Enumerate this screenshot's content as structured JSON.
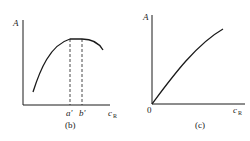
{
  "panels": [
    {
      "id": "b",
      "caption": "(b)",
      "y_label": "A",
      "x_label": "c",
      "x_label_sub": "R",
      "ticks": [
        "a'",
        "b'"
      ],
      "curve": "rises steeply, plateaus between a' and b', then decreases"
    },
    {
      "id": "c",
      "caption": "(c)",
      "y_label": "A",
      "x_label": "c",
      "x_label_sub": "R",
      "origin_label": "0",
      "curve": "monotonically increasing from origin, concave"
    }
  ],
  "colors": {
    "line": "#1a1a1a",
    "background": "#ffffff"
  }
}
